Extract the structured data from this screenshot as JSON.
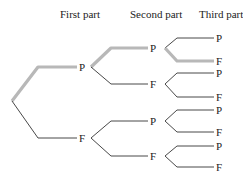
{
  "headers": {
    "first": "First part",
    "second": "Second part",
    "third": "Third part"
  },
  "tree": {
    "level1": [
      {
        "label": "P",
        "highlighted": true
      },
      {
        "label": "F",
        "highlighted": false
      }
    ],
    "level2": [
      {
        "label": "P",
        "parent": 0,
        "highlighted": true
      },
      {
        "label": "F",
        "parent": 0,
        "highlighted": false
      },
      {
        "label": "P",
        "parent": 1,
        "highlighted": false
      },
      {
        "label": "F",
        "parent": 1,
        "highlighted": false
      }
    ],
    "level3": [
      {
        "label": "P",
        "parent": 0,
        "highlighted": false
      },
      {
        "label": "F",
        "parent": 0,
        "highlighted": true
      },
      {
        "label": "P",
        "parent": 1,
        "highlighted": false
      },
      {
        "label": "F",
        "parent": 1,
        "highlighted": false
      },
      {
        "label": "P",
        "parent": 2,
        "highlighted": false
      },
      {
        "label": "F",
        "parent": 2,
        "highlighted": false
      },
      {
        "label": "P",
        "parent": 3,
        "highlighted": false
      },
      {
        "label": "F",
        "parent": 3,
        "highlighted": false
      }
    ]
  },
  "colors": {
    "highlight_path": "#b8b8b8",
    "edge": "#333333"
  }
}
